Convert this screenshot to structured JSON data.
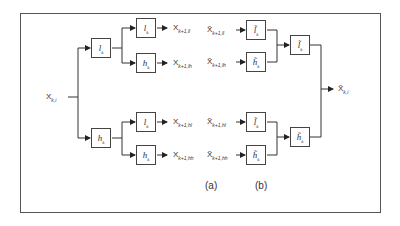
{
  "diagram": {
    "type": "wavelet packet decomposition / reconstruction tree",
    "input": {
      "symbol": "X",
      "subscript": "k,i"
    },
    "output": {
      "symbol": "X̃",
      "subscript": "k,i"
    },
    "analysis": {
      "level1": [
        {
          "filter": "l",
          "subscript": "k"
        },
        {
          "filter": "h",
          "subscript": "k"
        }
      ],
      "level2": [
        {
          "filter": "l",
          "subscript": "k",
          "output": "X",
          "output_sub": "k+1,ll"
        },
        {
          "filter": "h",
          "subscript": "k",
          "output": "X",
          "output_sub": "k+1,lh"
        },
        {
          "filter": "l",
          "subscript": "k",
          "output": "X",
          "output_sub": "k+1,hl"
        },
        {
          "filter": "h",
          "subscript": "k",
          "output": "X",
          "output_sub": "k+1,hh"
        }
      ]
    },
    "synthesis": {
      "level2": [
        {
          "input": "X̃",
          "input_sub": "k+1,ll",
          "filter": "l̃",
          "subscript": "k"
        },
        {
          "input": "X̃",
          "input_sub": "k+1,lh",
          "filter": "h̃",
          "subscript": "k"
        },
        {
          "input": "X̃",
          "input_sub": "k+1,hl",
          "filter": "l̃",
          "subscript": "k"
        },
        {
          "input": "X̃",
          "input_sub": "k+1,hh",
          "filter": "h̃",
          "subscript": "k"
        }
      ],
      "level1": [
        {
          "filter": "l̃",
          "subscript": "k"
        },
        {
          "filter": "h̃",
          "subscript": "k"
        }
      ]
    },
    "captions": {
      "a": "(a)",
      "b": "(b)"
    }
  }
}
